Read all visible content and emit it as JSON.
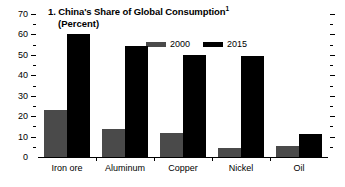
{
  "chart_data": {
    "type": "bar",
    "title": "1. China's Share of Global Consumption",
    "title_number": "1.",
    "title_text": "China's Share of Global Consumption",
    "title_footnote_marker": "1",
    "subtitle": "(Percent)",
    "xlabel": "",
    "ylabel": "",
    "ylim": [
      0,
      70
    ],
    "y_ticks": [
      0,
      10,
      20,
      30,
      40,
      50,
      60,
      70
    ],
    "y_minor_ticks": [
      5,
      15,
      25,
      35,
      45,
      55,
      65
    ],
    "grid": false,
    "legend_position": "top-center",
    "categories": [
      "Iron ore",
      "Aluminum",
      "Copper",
      "Nickel",
      "Oil"
    ],
    "series": [
      {
        "name": "2000",
        "color": "#4a4a4a",
        "values": [
          23,
          13.5,
          12,
          4.5,
          5.5
        ]
      },
      {
        "name": "2015",
        "color": "#000000",
        "values": [
          60,
          54.5,
          50,
          49.5,
          11.5
        ]
      }
    ]
  },
  "axis": {
    "y_tick_labels": [
      "70",
      "60",
      "50",
      "40",
      "30",
      "20",
      "10",
      "0"
    ]
  },
  "legend": {
    "entries": [
      {
        "label": "2000",
        "color": "#4a4a4a"
      },
      {
        "label": "2015",
        "color": "#000000"
      }
    ]
  },
  "colors": {
    "series_2000": "#4a4a4a",
    "series_2015": "#000000",
    "axis": "#000000",
    "background": "#ffffff"
  }
}
